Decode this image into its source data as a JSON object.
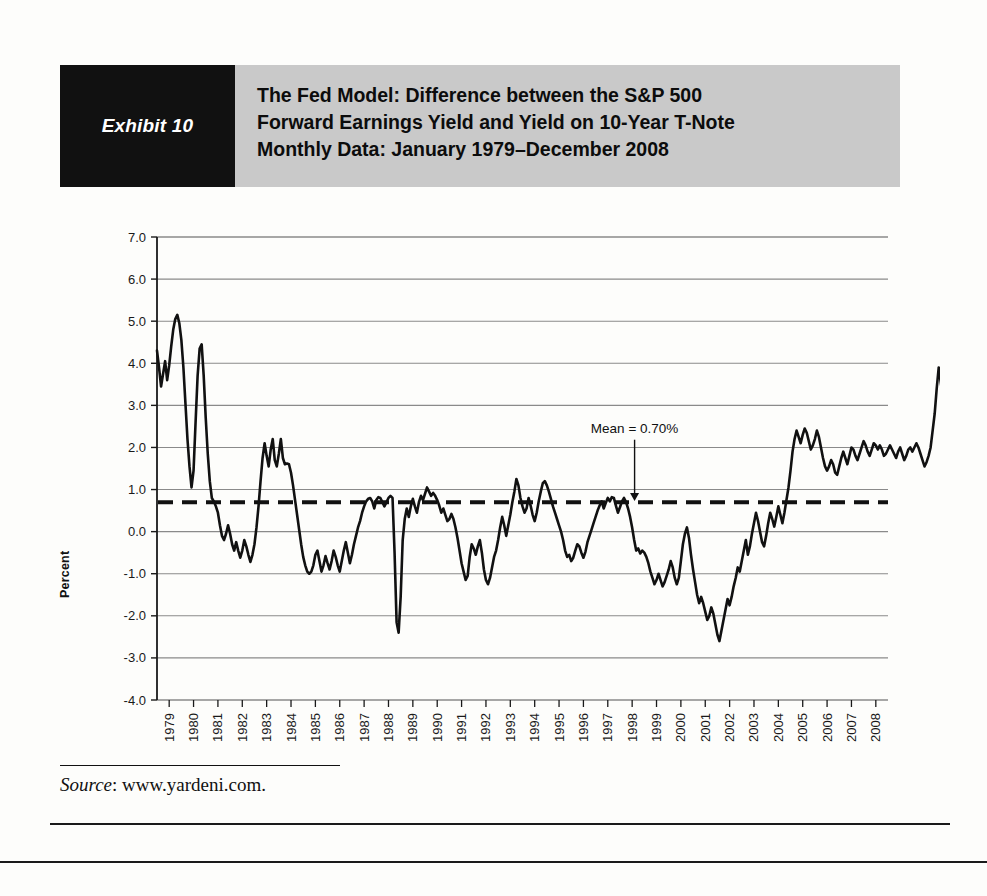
{
  "header": {
    "exhibit_tag": "Exhibit 10",
    "title_lines": [
      "The Fed Model: Difference between the S&P 500",
      "Forward Earnings Yield and Yield on 10-Year T-Note",
      "Monthly Data: January 1979–December 2008"
    ],
    "tag_bg": "#111111",
    "band_bg": "#c9c9c9"
  },
  "source": {
    "label": "Source",
    "separator": ": ",
    "value": "www.yardeni.com."
  },
  "chart_data": {
    "type": "line",
    "title": "The Fed Model: Difference between the S&P 500 Forward Earnings Yield and Yield on 10-Year T-Note",
    "subtitle": "Monthly Data: January 1979–December 2008",
    "xlabel": "",
    "ylabel": "Percent",
    "ylim": [
      -4.0,
      7.0
    ],
    "ytick_step": 1.0,
    "yticks": [
      "7.0",
      "6.0",
      "5.0",
      "4.0",
      "3.0",
      "2.0",
      "1.0",
      "0.0",
      "-1.0",
      "-2.0",
      "-3.0",
      "-4.0"
    ],
    "ytick_values": [
      7.0,
      6.0,
      5.0,
      4.0,
      3.0,
      2.0,
      1.0,
      0.0,
      -1.0,
      -2.0,
      -3.0,
      -4.0
    ],
    "xlim": [
      1979.0,
      2009.0
    ],
    "xticks": [
      "1979",
      "1980",
      "1981",
      "1982",
      "1983",
      "1984",
      "1985",
      "1986",
      "1987",
      "1988",
      "1989",
      "1990",
      "1991",
      "1992",
      "1993",
      "1994",
      "1995",
      "1996",
      "1997",
      "1998",
      "1999",
      "2000",
      "2001",
      "2002",
      "2003",
      "2004",
      "2005",
      "2006",
      "2007",
      "2008"
    ],
    "grid": "horizontal",
    "legend": "none",
    "line_color": "#111111",
    "grid_color": "#8a8a8a",
    "annotations": [
      {
        "text": "Mean = 0.70%",
        "x": 1998.6,
        "y": 2.35,
        "arrow_to_y": 0.75,
        "arrow": "down"
      }
    ],
    "reference_lines": [
      {
        "label": "Mean",
        "value": 0.7,
        "style": "dashed",
        "color": "#111111",
        "width": 4
      }
    ],
    "series": [
      {
        "name": "S&P 500 Forward Earnings Yield minus 10-Year T-Note Yield",
        "x_start": 1979.0,
        "x_step": 0.08333,
        "values": [
          4.3,
          3.9,
          3.45,
          3.75,
          4.05,
          3.6,
          3.95,
          4.4,
          4.8,
          5.05,
          5.15,
          4.95,
          4.55,
          3.9,
          3.05,
          2.2,
          1.55,
          1.05,
          1.45,
          2.6,
          3.7,
          4.35,
          4.45,
          3.7,
          2.7,
          1.85,
          1.2,
          0.8,
          0.72,
          0.6,
          0.45,
          0.15,
          -0.1,
          -0.2,
          -0.05,
          0.15,
          -0.05,
          -0.3,
          -0.45,
          -0.25,
          -0.45,
          -0.62,
          -0.45,
          -0.2,
          -0.35,
          -0.55,
          -0.72,
          -0.55,
          -0.3,
          0.1,
          0.6,
          1.2,
          1.75,
          2.1,
          1.8,
          1.55,
          1.95,
          2.2,
          1.7,
          1.55,
          1.85,
          2.2,
          1.75,
          1.6,
          1.62,
          1.6,
          1.4,
          1.1,
          0.75,
          0.4,
          0.05,
          -0.3,
          -0.6,
          -0.8,
          -0.95,
          -1.0,
          -0.95,
          -0.8,
          -0.55,
          -0.45,
          -0.7,
          -0.95,
          -0.8,
          -0.58,
          -0.75,
          -0.9,
          -0.7,
          -0.45,
          -0.6,
          -0.8,
          -0.95,
          -0.7,
          -0.45,
          -0.25,
          -0.5,
          -0.75,
          -0.55,
          -0.3,
          -0.1,
          0.1,
          0.25,
          0.45,
          0.6,
          0.72,
          0.78,
          0.8,
          0.72,
          0.55,
          0.75,
          0.82,
          0.8,
          0.7,
          0.6,
          0.7,
          0.8,
          0.85,
          0.8,
          -0.5,
          -2.15,
          -2.4,
          -1.55,
          -0.2,
          0.3,
          0.55,
          0.35,
          0.6,
          0.78,
          0.6,
          0.45,
          0.7,
          0.85,
          0.75,
          0.9,
          1.05,
          0.95,
          0.85,
          0.92,
          0.85,
          0.75,
          0.62,
          0.45,
          0.55,
          0.4,
          0.25,
          0.3,
          0.42,
          0.3,
          0.1,
          -0.15,
          -0.45,
          -0.75,
          -0.95,
          -1.15,
          -1.05,
          -0.6,
          -0.3,
          -0.4,
          -0.55,
          -0.35,
          -0.2,
          -0.5,
          -0.9,
          -1.15,
          -1.25,
          -1.1,
          -0.85,
          -0.6,
          -0.45,
          -0.2,
          0.1,
          0.35,
          0.15,
          -0.1,
          0.15,
          0.4,
          0.7,
          0.95,
          1.25,
          1.1,
          0.8,
          0.6,
          0.45,
          0.55,
          0.8,
          0.62,
          0.4,
          0.25,
          0.45,
          0.72,
          0.95,
          1.15,
          1.2,
          1.1,
          0.95,
          0.78,
          0.6,
          0.45,
          0.3,
          0.15,
          0.0,
          -0.2,
          -0.45,
          -0.6,
          -0.55,
          -0.7,
          -0.62,
          -0.45,
          -0.3,
          -0.35,
          -0.5,
          -0.62,
          -0.48,
          -0.25,
          -0.1,
          0.05,
          0.2,
          0.35,
          0.5,
          0.62,
          0.72,
          0.55,
          0.68,
          0.8,
          0.72,
          0.82,
          0.8,
          0.62,
          0.45,
          0.58,
          0.72,
          0.8,
          0.7,
          0.55,
          0.35,
          0.1,
          -0.2,
          -0.45,
          -0.4,
          -0.52,
          -0.45,
          -0.5,
          -0.6,
          -0.75,
          -0.95,
          -1.1,
          -1.25,
          -1.15,
          -1.0,
          -1.15,
          -1.3,
          -1.2,
          -1.05,
          -0.9,
          -0.7,
          -0.85,
          -1.1,
          -1.25,
          -1.1,
          -0.7,
          -0.3,
          -0.05,
          0.1,
          -0.15,
          -0.55,
          -0.9,
          -1.2,
          -1.5,
          -1.7,
          -1.55,
          -1.7,
          -1.9,
          -2.1,
          -2.0,
          -1.8,
          -1.95,
          -2.2,
          -2.45,
          -2.6,
          -2.35,
          -2.1,
          -1.85,
          -1.6,
          -1.75,
          -1.55,
          -1.3,
          -1.1,
          -0.85,
          -0.95,
          -0.7,
          -0.45,
          -0.2,
          -0.55,
          -0.35,
          -0.05,
          0.2,
          0.45,
          0.25,
          0.0,
          -0.25,
          -0.35,
          -0.1,
          0.2,
          0.45,
          0.3,
          0.12,
          0.35,
          0.6,
          0.4,
          0.2,
          0.45,
          0.75,
          1.05,
          1.45,
          1.9,
          2.2,
          2.4,
          2.25,
          2.1,
          2.3,
          2.45,
          2.35,
          2.15,
          1.95,
          2.05,
          2.2,
          2.4,
          2.25,
          2.0,
          1.75,
          1.55,
          1.45,
          1.55,
          1.7,
          1.6,
          1.4,
          1.35,
          1.55,
          1.75,
          1.9,
          1.75,
          1.6,
          1.8,
          2.0,
          1.95,
          1.8,
          1.7,
          1.85,
          2.0,
          2.15,
          2.05,
          1.9,
          1.8,
          1.95,
          2.1,
          2.05,
          1.95,
          2.05,
          1.95,
          1.8,
          1.85,
          1.95,
          2.05,
          1.95,
          1.85,
          1.75,
          1.9,
          2.0,
          1.85,
          1.7,
          1.8,
          1.95,
          2.0,
          1.9,
          2.0,
          2.1,
          2.0,
          1.85,
          1.7,
          1.55,
          1.65,
          1.8,
          2.0,
          2.4,
          2.8,
          3.4,
          3.9,
          3.55,
          3.2
        ]
      }
    ]
  }
}
